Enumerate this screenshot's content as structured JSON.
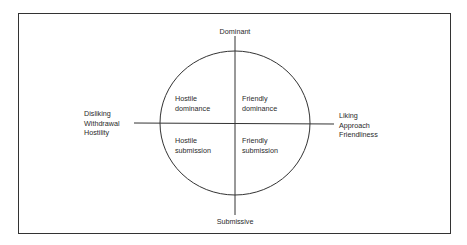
{
  "diagram": {
    "axes": {
      "top": "Dominant",
      "bottom": "Submissive",
      "left": [
        "Disliking",
        "Withdrawal",
        "Hostility"
      ],
      "right": [
        "Liking",
        "Approach",
        "Friendliness"
      ]
    },
    "quadrants": {
      "top_left": [
        "Hostile",
        "dominance"
      ],
      "top_right": [
        "Friendly",
        "dominance"
      ],
      "bottom_left": [
        "Hostile",
        "submission"
      ],
      "bottom_right": [
        "Friendly",
        "submission"
      ]
    }
  }
}
